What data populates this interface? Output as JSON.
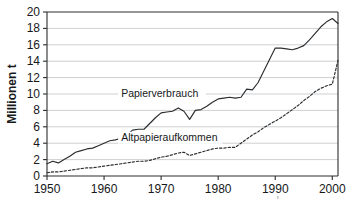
{
  "chart_data": {
    "type": "line",
    "title": "",
    "xlabel": "",
    "ylabel": "Millionen t",
    "xlim": [
      1950,
      2001
    ],
    "ylim": [
      0,
      20
    ],
    "xticks": [
      1950,
      1960,
      1970,
      1980,
      1990,
      2000
    ],
    "yticks": [
      0,
      2,
      4,
      6,
      8,
      10,
      12,
      14,
      16,
      18,
      20
    ],
    "grid": true,
    "legend_position": "inline-labels",
    "series": [
      {
        "name": "Papierverbrauch",
        "style": "solid",
        "color": "#2b2d2f",
        "label_x": 1963,
        "label_y": 9.6,
        "x": [
          1950,
          1951,
          1952,
          1953,
          1954,
          1955,
          1956,
          1957,
          1958,
          1959,
          1960,
          1961,
          1962,
          1963,
          1964,
          1965,
          1966,
          1967,
          1968,
          1969,
          1970,
          1971,
          1972,
          1973,
          1974,
          1975,
          1976,
          1977,
          1978,
          1979,
          1980,
          1981,
          1982,
          1983,
          1984,
          1985,
          1986,
          1987,
          1988,
          1989,
          1990,
          1991,
          1992,
          1993,
          1994,
          1995,
          1996,
          1997,
          1998,
          1999,
          2000,
          2001
        ],
        "values": [
          1.5,
          1.8,
          1.6,
          2.0,
          2.4,
          2.9,
          3.1,
          3.3,
          3.4,
          3.7,
          4.0,
          4.3,
          4.4,
          4.6,
          5.0,
          5.6,
          5.7,
          5.7,
          6.4,
          7.1,
          7.7,
          7.8,
          7.9,
          8.3,
          7.9,
          6.9,
          8.0,
          8.1,
          8.5,
          9.0,
          9.4,
          9.5,
          9.6,
          9.5,
          9.6,
          10.6,
          10.5,
          11.4,
          12.8,
          14.2,
          15.6,
          15.6,
          15.5,
          15.4,
          15.6,
          15.9,
          16.6,
          17.4,
          18.2,
          18.8,
          19.2,
          18.6
        ]
      },
      {
        "name": "Altpapieraufkommen",
        "style": "dashed",
        "color": "#2b2d2f",
        "label_x": 1963,
        "label_y": 4.3,
        "x": [
          1950,
          1951,
          1952,
          1953,
          1954,
          1955,
          1956,
          1957,
          1958,
          1959,
          1960,
          1961,
          1962,
          1963,
          1964,
          1965,
          1966,
          1967,
          1968,
          1969,
          1970,
          1971,
          1972,
          1973,
          1974,
          1975,
          1976,
          1977,
          1978,
          1979,
          1980,
          1981,
          1982,
          1983,
          1984,
          1985,
          1986,
          1987,
          1988,
          1989,
          1990,
          1991,
          1992,
          1993,
          1994,
          1995,
          1996,
          1997,
          1998,
          1999,
          2000,
          2001
        ],
        "values": [
          0.4,
          0.5,
          0.5,
          0.6,
          0.7,
          0.8,
          0.9,
          1.0,
          1.0,
          1.1,
          1.2,
          1.3,
          1.4,
          1.5,
          1.6,
          1.7,
          1.8,
          1.8,
          1.9,
          2.1,
          2.3,
          2.4,
          2.6,
          2.8,
          2.9,
          2.5,
          2.7,
          2.9,
          3.1,
          3.3,
          3.4,
          3.4,
          3.5,
          3.5,
          4.0,
          4.5,
          5.0,
          5.4,
          5.9,
          6.3,
          6.7,
          7.1,
          7.6,
          8.1,
          8.6,
          9.2,
          9.7,
          10.3,
          10.7,
          11.0,
          11.2,
          14.1
        ]
      }
    ]
  }
}
